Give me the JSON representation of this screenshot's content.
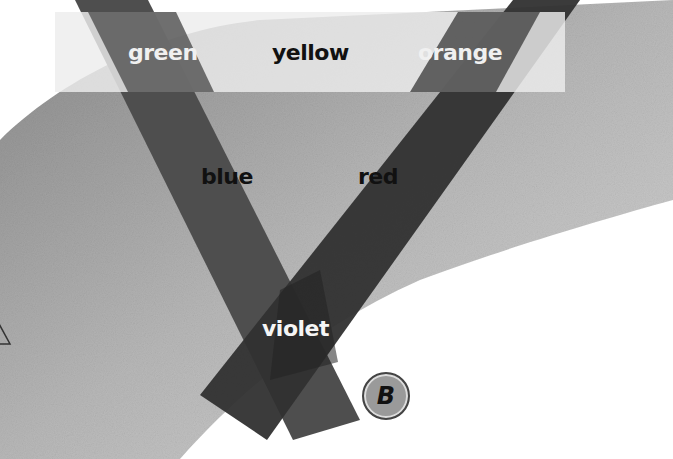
{
  "diagram": {
    "labels": {
      "green": "green",
      "yellow": "yellow",
      "orange": "orange",
      "blue": "blue",
      "red": "red",
      "violet": "violet"
    },
    "badge": "B",
    "colors": {
      "band_blue": "#4a4a4a",
      "band_red": "#2e2e2e",
      "overlap": "#222222",
      "strip": "#e2e2e2",
      "blob": "#a8a8a8"
    }
  }
}
